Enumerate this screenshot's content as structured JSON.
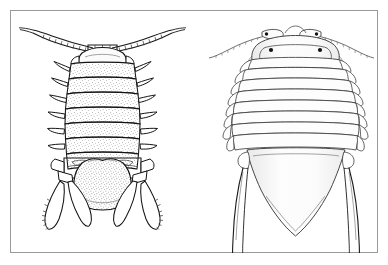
{
  "figure": {
    "background_color": "#ffffff",
    "frame_color": "#9a9a9a",
    "ink_color": "#1a1a1a",
    "panel_count": 2,
    "medium": "pen-and-ink line drawing with stipple shading"
  },
  "specimens": [
    {
      "id": "left-specimen",
      "name": "isopod-ventral-view",
      "view": "ventral",
      "shading": "dense stipple texture",
      "parts": {
        "antennae": "two long segmented antennae sweeping outward and upward",
        "antenna_segment_count": 7,
        "head": "small rounded cephalon between antennal bases",
        "pereon_segments": 7,
        "legs_per_side": 6,
        "telson": "broad rounded terminal plate",
        "uropods": "paired forked claw-like appendages",
        "uropod_rami_per_side": 2
      }
    },
    {
      "id": "right-specimen",
      "name": "isopod-dorsal-view",
      "view": "dorsal",
      "shading": "light outline with faint wash",
      "parts": {
        "antennae": "two long slender antennae curving laterally",
        "eyes": 2,
        "eye_color": "#111111",
        "head": "wide rounded cephalon with lateral lobes",
        "pereon_segments": 7,
        "epimeres_per_side": 7,
        "telson": "elongate triangular pleotelson tapering to a point",
        "uropods": "paired long needle-like rami extending past the telson",
        "uropod_rami_per_side": 2
      }
    }
  ],
  "annotations": {
    "visible_labels": [],
    "caption": ""
  }
}
